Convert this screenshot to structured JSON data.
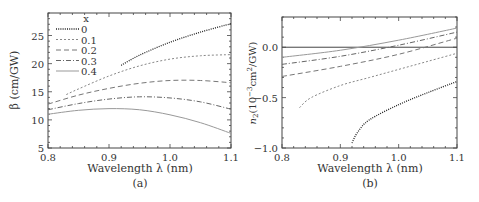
{
  "chart_data": [
    {
      "type": "line",
      "panel": "(a)",
      "title": "",
      "xlabel": "Wavelength λ (nm)",
      "ylabel": "β (cm/GW)",
      "xlim": [
        0.8,
        1.1
      ],
      "ylim": [
        5,
        29
      ],
      "xticks": [
        "0.8",
        "0.9",
        "1.0",
        "1.1"
      ],
      "xtick_values": [
        0.8,
        0.9,
        1.0,
        1.1
      ],
      "yticks": [
        "5",
        "10",
        "15",
        "20",
        "25"
      ],
      "ytick_values": [
        5,
        10,
        15,
        20,
        25
      ],
      "grid": false,
      "legend": {
        "title": "x",
        "position": "upper left",
        "entries": [
          "0",
          "0.1",
          "0.2",
          "0.3",
          "0.4"
        ]
      },
      "series": [
        {
          "name": "0",
          "style": "dotted",
          "x": [
            0.92,
            0.95,
            1.0,
            1.05,
            1.1
          ],
          "values": [
            19.7,
            21.5,
            23.8,
            25.6,
            27.1
          ]
        },
        {
          "name": "0.1",
          "style": "short-dash",
          "x": [
            0.83,
            0.85,
            0.9,
            0.95,
            1.0,
            1.05,
            1.1
          ],
          "values": [
            14.5,
            15.5,
            17.8,
            19.6,
            20.8,
            21.4,
            21.6
          ]
        },
        {
          "name": "0.2",
          "style": "dashed",
          "x": [
            0.8,
            0.85,
            0.9,
            0.95,
            1.0,
            1.05,
            1.1
          ],
          "values": [
            12.8,
            14.4,
            15.6,
            16.5,
            17.0,
            17.0,
            16.6
          ]
        },
        {
          "name": "0.3",
          "style": "dash-dot",
          "x": [
            0.8,
            0.85,
            0.9,
            0.95,
            1.0,
            1.05,
            1.1
          ],
          "values": [
            11.8,
            12.9,
            13.7,
            14.1,
            13.9,
            13.2,
            11.9
          ]
        },
        {
          "name": "0.4",
          "style": "solid",
          "x": [
            0.8,
            0.85,
            0.9,
            0.95,
            1.0,
            1.05,
            1.1
          ],
          "values": [
            11.0,
            11.7,
            12.0,
            11.8,
            10.9,
            9.5,
            7.6
          ]
        }
      ]
    },
    {
      "type": "line",
      "panel": "(b)",
      "title": "",
      "xlabel": "Wavelength λ (nm)",
      "ylabel": "n2(10^-3 cm^2/GW)",
      "xlim": [
        0.8,
        1.1
      ],
      "ylim": [
        -1.0,
        0.3
      ],
      "xticks": [
        "0.8",
        "0.9",
        "1.0",
        "1.1"
      ],
      "xtick_values": [
        0.8,
        0.9,
        1.0,
        1.1
      ],
      "yticks": [
        "-1.0",
        "-0.5",
        "0.0"
      ],
      "ytick_values": [
        -1.0,
        -0.5,
        0.0
      ],
      "grid": false,
      "reference_line": {
        "y": 0.0,
        "style": "solid"
      },
      "series": [
        {
          "name": "0",
          "style": "dotted",
          "x": [
            0.92,
            0.93,
            0.95,
            1.0,
            1.05,
            1.1
          ],
          "values": [
            -0.95,
            -0.84,
            -0.72,
            -0.57,
            -0.45,
            -0.34
          ]
        },
        {
          "name": "0.1",
          "style": "short-dash",
          "x": [
            0.83,
            0.85,
            0.9,
            0.95,
            1.0,
            1.05,
            1.1
          ],
          "values": [
            -0.6,
            -0.5,
            -0.38,
            -0.3,
            -0.22,
            -0.14,
            -0.06
          ]
        },
        {
          "name": "0.2",
          "style": "dashed",
          "x": [
            0.8,
            0.9,
            1.0,
            1.1
          ],
          "values": [
            -0.29,
            -0.19,
            -0.07,
            0.09
          ]
        },
        {
          "name": "0.3",
          "style": "dash-dot",
          "x": [
            0.8,
            0.9,
            1.0,
            1.1
          ],
          "values": [
            -0.17,
            -0.09,
            0.02,
            0.15
          ]
        },
        {
          "name": "0.4",
          "style": "solid",
          "x": [
            0.8,
            0.9,
            1.0,
            1.1
          ],
          "values": [
            -0.1,
            -0.03,
            0.07,
            0.19
          ]
        }
      ]
    }
  ],
  "panels": {
    "a": {
      "caption": "(a)",
      "xlabel": "Wavelength λ (nm)",
      "ylabel": "β (cm/GW)",
      "legend_title": "x"
    },
    "b": {
      "caption": "(b)",
      "xlabel": "Wavelength λ (nm)",
      "ylabel_main": "n",
      "ylabel_sub": "2",
      "ylabel_rest": "(10",
      "ylabel_exp": "−3",
      "ylabel_unit": "cm",
      "ylabel_unit_exp": "2",
      "ylabel_tail": "/GW)"
    }
  }
}
